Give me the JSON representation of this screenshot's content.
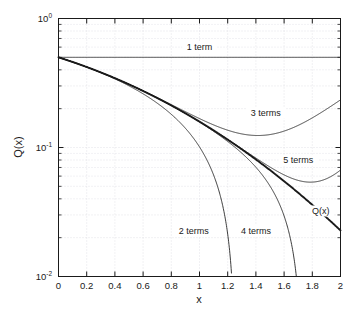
{
  "chart_data": {
    "type": "line",
    "title": "",
    "xlabel": "x",
    "ylabel": "Q(x)",
    "xlim": [
      0,
      2
    ],
    "ylim": [
      0.01,
      1
    ],
    "yscale": "log",
    "xscale": "linear",
    "grid": true,
    "legend": "inline-annotations",
    "xticks": [
      "0",
      "0.2",
      "0.4",
      "0.6",
      "0.8",
      "1",
      "1.2",
      "1.4",
      "1.6",
      "1.8",
      "2"
    ],
    "xtick_values": [
      0,
      0.2,
      0.4,
      0.6,
      0.8,
      1,
      1.2,
      1.4,
      1.6,
      1.8,
      2
    ],
    "ytick_labels": [
      "10",
      "10",
      "10"
    ],
    "ytick_exponents": [
      "0",
      "-1",
      "-2"
    ],
    "ytick_values": [
      1,
      0.1,
      0.01
    ],
    "series": [
      {
        "name": "1 term",
        "label": "1 term",
        "label_x": 1.0,
        "label_y": 0.565,
        "style": "thin",
        "values": [
          0.5,
          0.5,
          0.5,
          0.5,
          0.5,
          0.5,
          0.5,
          0.5,
          0.5,
          0.5,
          0.5
        ]
      },
      {
        "name": "2 terms",
        "label": "2 terms",
        "label_x": 0.96,
        "label_y": 0.0215,
        "style": "thin",
        "x": [
          0,
          0.2,
          0.4,
          0.6,
          0.8,
          1.0,
          1.1,
          1.15,
          1.19
        ],
        "values": [
          0.5,
          0.4202,
          0.3404,
          0.2606,
          0.1808,
          0.101,
          0.0611,
          0.0412,
          0.0252
        ]
      },
      {
        "name": "3 terms",
        "label": "3 terms",
        "label_x": 1.47,
        "label_y": 0.175,
        "style": "thin",
        "x": [
          0,
          0.2,
          0.4,
          0.6,
          0.8,
          1.0,
          1.2,
          1.4,
          1.6,
          1.8,
          2.0
        ],
        "values": [
          0.5,
          0.4213,
          0.3489,
          0.2886,
          0.2449,
          0.2175,
          0.1964,
          0.1323,
          0.1363,
          0.1733,
          0.2329
        ]
      },
      {
        "name": "4 terms",
        "label": "4 terms",
        "label_x": 1.4,
        "label_y": 0.0215,
        "style": "thin",
        "x": [
          0,
          0.4,
          0.8,
          1.0,
          1.2,
          1.4,
          1.55,
          1.63,
          1.66
        ],
        "values": [
          0.5,
          0.3446,
          0.2119,
          0.1543,
          0.1015,
          0.052,
          0.0245,
          0.0137,
          0.0108
        ]
      },
      {
        "name": "5 terms",
        "label": "5 terms",
        "label_x": 1.7,
        "label_y": 0.0755,
        "style": "thin",
        "x": [
          0,
          0.4,
          0.8,
          1.0,
          1.2,
          1.4,
          1.6,
          1.8,
          1.9,
          2.0
        ],
        "values": [
          0.5,
          0.3446,
          0.212,
          0.1587,
          0.1155,
          0.0829,
          0.062,
          0.0551,
          0.057,
          0.0638
        ]
      },
      {
        "name": "Q(x)",
        "label": "Q(x)",
        "label_x": 1.86,
        "label_y": 0.0305,
        "style": "thick",
        "x": [
          0,
          0.2,
          0.4,
          0.6,
          0.8,
          1.0,
          1.2,
          1.4,
          1.6,
          1.8,
          2.0
        ],
        "values": [
          0.5,
          0.4207,
          0.3446,
          0.2743,
          0.2119,
          0.1587,
          0.1151,
          0.0808,
          0.0548,
          0.0359,
          0.0228
        ]
      }
    ]
  },
  "colors": {
    "axis": "#1a1a1a",
    "grid": "#d8d8e0",
    "curve": "#1a1a1a",
    "background": "#ffffff"
  }
}
